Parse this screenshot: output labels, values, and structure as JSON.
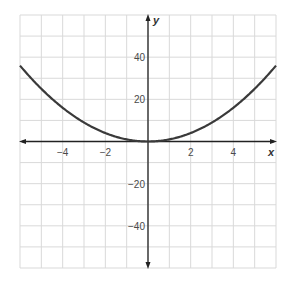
{
  "chart_data": {
    "type": "line",
    "title": "",
    "xlabel": "x",
    "ylabel": "y",
    "xlim": [
      -6,
      6
    ],
    "ylim": [
      -60,
      60
    ],
    "grid": true,
    "grid_x_step": 1,
    "grid_y_step": 10,
    "x_ticks": [
      {
        "value": -4,
        "label": "−4"
      },
      {
        "value": -2,
        "label": "−2"
      },
      {
        "value": 2,
        "label": "2"
      },
      {
        "value": 4,
        "label": "4"
      }
    ],
    "y_ticks": [
      {
        "value": 40,
        "label": "40"
      },
      {
        "value": 20,
        "label": "20"
      },
      {
        "value": -20,
        "label": "−20"
      },
      {
        "value": -40,
        "label": "−40"
      }
    ],
    "series": [
      {
        "name": "y = x^2",
        "equation": "y = x^2",
        "x": [
          -6,
          -5,
          -4,
          -3,
          -2,
          -1,
          0,
          1,
          2,
          3,
          4,
          5,
          6
        ],
        "values": [
          36,
          25,
          16,
          9,
          4,
          1,
          0,
          1,
          4,
          9,
          16,
          25,
          36
        ]
      }
    ],
    "colors": {
      "grid": "#d9d9d9",
      "axis": "#222222",
      "curve": "#3a3a3a"
    }
  }
}
